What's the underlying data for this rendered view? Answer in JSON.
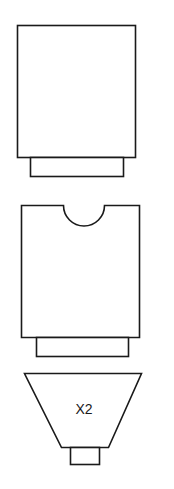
{
  "diagram": {
    "stroke_color": "#1a1a1a",
    "background": "#ffffff",
    "shapes": [
      {
        "name": "rectangle-with-base",
        "label": ""
      },
      {
        "name": "notched-rectangle-with-base",
        "label": ""
      },
      {
        "name": "funnel-with-nozzle",
        "label": "X2"
      }
    ]
  }
}
